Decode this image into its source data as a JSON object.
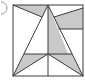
{
  "figure": {
    "label": "circled-number-partial",
    "colors": {
      "shade": "#c9c9c9",
      "line": "#3a3a3a",
      "background": "#ffffff"
    },
    "square": {
      "x": 13,
      "y": 5,
      "size_w": 70,
      "size_h": 71
    },
    "points": {
      "top_left": [
        13,
        5
      ],
      "top_right": [
        83,
        5
      ],
      "bottom_left": [
        13,
        76
      ],
      "bottom_right": [
        83,
        76
      ],
      "apex": [
        48,
        5
      ],
      "center": [
        48,
        54
      ],
      "left_mid": [
        24,
        54
      ],
      "right_mid": [
        72,
        54
      ],
      "left_upper": [
        42,
        17
      ],
      "right_upper": [
        54,
        17
      ]
    },
    "shaded_regions": [
      "top-left-triangle",
      "top-right-quadrilateral",
      "central-strip",
      "bottom-left-triangle",
      "bottom-right-triangle"
    ]
  }
}
